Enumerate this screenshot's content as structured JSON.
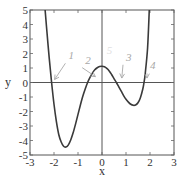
{
  "chart_data": {
    "type": "line",
    "title": "",
    "xlabel": "x",
    "ylabel": "y",
    "xlim": [
      -3,
      3
    ],
    "ylim": [
      -5,
      5
    ],
    "xticks": [
      -3,
      -2,
      -1,
      0,
      1,
      2,
      3
    ],
    "yticks": [
      -5,
      -4,
      -3,
      -2,
      -1,
      0,
      1,
      2,
      3,
      4,
      5
    ],
    "grid": false,
    "legend": null,
    "reference_lines": {
      "x": 0,
      "y": 0
    },
    "series": [
      {
        "name": "f(x)",
        "color": "#3a3a3a",
        "x": [
          -2.37,
          -2.3,
          -2.2,
          -2.1,
          -2.0,
          -1.9,
          -1.8,
          -1.7,
          -1.6,
          -1.5,
          -1.4,
          -1.3,
          -1.2,
          -1.1,
          -1.0,
          -0.9,
          -0.8,
          -0.7,
          -0.6,
          -0.5,
          -0.4,
          -0.3,
          -0.2,
          -0.1,
          0.0,
          0.1,
          0.2,
          0.3,
          0.4,
          0.5,
          0.6,
          0.7,
          0.8,
          0.9,
          1.0,
          1.1,
          1.2,
          1.3,
          1.4,
          1.5,
          1.6,
          1.7,
          1.75,
          1.8,
          1.9,
          1.97
        ],
        "y": [
          5.0,
          3.6,
          1.7,
          0.0,
          -1.5,
          -2.7,
          -3.6,
          -4.1,
          -4.4,
          -4.45,
          -4.3,
          -3.95,
          -3.45,
          -2.85,
          -2.2,
          -1.55,
          -0.95,
          -0.45,
          0.0,
          0.35,
          0.65,
          0.88,
          1.02,
          1.1,
          1.12,
          1.08,
          0.97,
          0.8,
          0.55,
          0.27,
          0.0,
          -0.3,
          -0.6,
          -0.9,
          -1.15,
          -1.35,
          -1.5,
          -1.57,
          -1.55,
          -1.4,
          -1.05,
          -0.45,
          0.0,
          0.6,
          2.4,
          5.0
        ]
      }
    ],
    "annotations": [
      {
        "label": "1",
        "x": -2.1,
        "y": 0.0,
        "text_at": [
          -1.4,
          1.6
        ]
      },
      {
        "label": "2",
        "x": -0.4,
        "y": 0.2,
        "text_at": [
          -0.7,
          1.3
        ]
      },
      {
        "label": "3",
        "x": 0.7,
        "y": 0.1,
        "text_at": [
          1.0,
          1.5
        ]
      },
      {
        "label": "4",
        "x": 1.75,
        "y": 0.1,
        "text_at": [
          2.0,
          0.9
        ]
      }
    ],
    "faint_mark": {
      "label": "5",
      "x": 0.2,
      "y": 2.0
    }
  },
  "labels": {
    "xlabel": "x",
    "ylabel": "y",
    "anno1": "1",
    "anno2": "2",
    "anno3": "3",
    "anno4": "4",
    "anno5": "5"
  },
  "xtick_labels": [
    "-3",
    "-2",
    "-1",
    "0",
    "1",
    "2",
    "3"
  ],
  "ytick_labels": [
    "5",
    "4",
    "3",
    "2",
    "1",
    "0",
    "-1",
    "-2",
    "-3",
    "-4",
    "-5"
  ]
}
